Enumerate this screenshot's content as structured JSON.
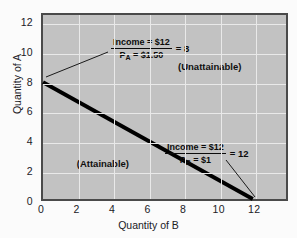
{
  "chart_data": {
    "type": "line",
    "title": "",
    "xlabel": "Quantity of B",
    "ylabel": "Quantity of A",
    "xlim": [
      0,
      13.9
    ],
    "ylim": [
      0,
      12.6
    ],
    "xticks": [
      "0",
      "2",
      "4",
      "6",
      "8",
      "10",
      "12"
    ],
    "xtick_values": [
      0,
      2,
      4,
      6,
      8,
      10,
      12
    ],
    "yticks": [
      "0",
      "2",
      "4",
      "6",
      "8",
      "10",
      "12"
    ],
    "ytick_values": [
      0,
      2,
      4,
      6,
      8,
      10,
      12
    ],
    "grid": true,
    "legend": "none",
    "series": [
      {
        "name": "Budget line",
        "x": [
          0,
          12
        ],
        "values": [
          8,
          0
        ],
        "color": "#000000",
        "linewidth": 4
      }
    ],
    "annotations": [
      {
        "id": "y-intercept-annotation",
        "numerator": "Income = $12",
        "denominator": "P",
        "denominator_sub": "A",
        "denominator_rest": " = $1.50",
        "equals": "= 8",
        "points_to": [
          0,
          8
        ]
      },
      {
        "id": "x-intercept-annotation",
        "numerator": "Income = $12",
        "denominator": "P",
        "denominator_sub": "B",
        "denominator_rest": " = $1",
        "equals": "= 12",
        "points_to": [
          12,
          0
        ]
      },
      {
        "id": "unattainable-region-label",
        "text": "(Unattainable)",
        "at": [
          7.6,
          9.1
        ]
      },
      {
        "id": "attainable-region-label",
        "text": "(Attainable)",
        "at": [
          1.9,
          2.6
        ]
      }
    ],
    "colors": {
      "plot_background": "#c2c2c2",
      "gridline": "#e9e9e9",
      "axis_border": "#4a4a4a",
      "line": "#000000",
      "text": "#20201f",
      "figure_background": "#fbfbfb"
    }
  }
}
